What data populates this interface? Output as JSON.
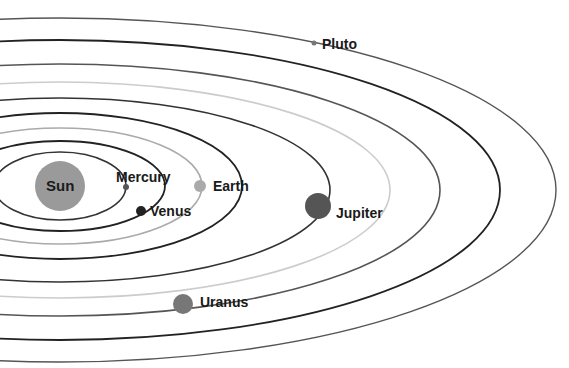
{
  "diagram": {
    "title": "",
    "sun": {
      "label": "Sun",
      "cx": 60,
      "cy": 186,
      "r": 25,
      "color": "#9a9a9a"
    },
    "orbits": [
      {
        "name": "mercury",
        "cx": 60,
        "cy": 186,
        "rx": 66,
        "ry": 34,
        "color": "#333333",
        "width": 1.6
      },
      {
        "name": "venus",
        "cx": 60,
        "cy": 186,
        "rx": 105,
        "ry": 45,
        "color": "#222222",
        "width": 1.8
      },
      {
        "name": "earth",
        "cx": 60,
        "cy": 186,
        "rx": 142,
        "ry": 58,
        "color": "#aaaaaa",
        "width": 1.6
      },
      {
        "name": "mars",
        "cx": 60,
        "cy": 186,
        "rx": 182,
        "ry": 73,
        "color": "#222222",
        "width": 1.8
      },
      {
        "name": "jupiter",
        "cx": 60,
        "cy": 190,
        "rx": 270,
        "ry": 92,
        "color": "#333333",
        "width": 1.6
      },
      {
        "name": "saturn",
        "cx": 60,
        "cy": 190,
        "rx": 330,
        "ry": 108,
        "color": "#cccccc",
        "width": 1.6
      },
      {
        "name": "uranus",
        "cx": 60,
        "cy": 190,
        "rx": 380,
        "ry": 126,
        "color": "#555555",
        "width": 1.6
      },
      {
        "name": "neptune",
        "cx": 60,
        "cy": 190,
        "rx": 440,
        "ry": 150,
        "color": "#222222",
        "width": 1.8
      },
      {
        "name": "pluto",
        "cx": 60,
        "cy": 190,
        "rx": 496,
        "ry": 172,
        "color": "#555555",
        "width": 1.4
      }
    ],
    "planets": [
      {
        "name": "Mercury",
        "cx": 126,
        "cy": 187,
        "r": 3,
        "color": "#555555",
        "label_x": 116,
        "label_y": 169
      },
      {
        "name": "Venus",
        "cx": 141,
        "cy": 211,
        "r": 5,
        "color": "#222222",
        "label_x": 150,
        "label_y": 203
      },
      {
        "name": "Earth",
        "cx": 200,
        "cy": 186,
        "r": 6,
        "color": "#aaaaaa",
        "label_x": 213,
        "label_y": 178
      },
      {
        "name": "Jupiter",
        "cx": 318,
        "cy": 206,
        "r": 13,
        "color": "#555555",
        "label_x": 336,
        "label_y": 205
      },
      {
        "name": "Uranus",
        "cx": 183,
        "cy": 304,
        "r": 10,
        "color": "#777777",
        "label_x": 200,
        "label_y": 294
      },
      {
        "name": "Pluto",
        "cx": 314,
        "cy": 43,
        "r": 2.5,
        "color": "#777777",
        "label_x": 322,
        "label_y": 36
      }
    ]
  }
}
